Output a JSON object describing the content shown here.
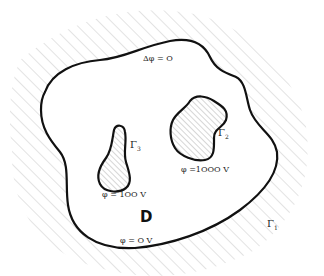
{
  "diagram": {
    "region_label": "D",
    "equation": "Δφ = O",
    "outer_boundary": {
      "name": "Γ",
      "index": "1",
      "condition": "φ = O V"
    },
    "inner_boundary_2": {
      "name": "Γ",
      "index": "2",
      "condition": "φ =1OOO V"
    },
    "inner_boundary_3": {
      "name": "Γ",
      "index": "3",
      "condition": "φ = 1OO V"
    }
  },
  "colors": {
    "outline": "#111111",
    "hatch": "#c8c8c8",
    "inner_hatch": "#999999",
    "background": "#ffffff"
  }
}
